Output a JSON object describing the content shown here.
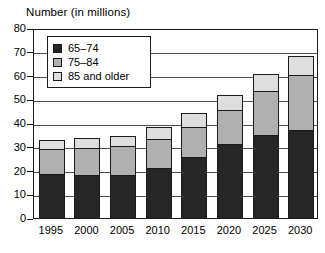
{
  "chart_data": {
    "type": "bar",
    "subtype": "stacked-vertical",
    "title": "Number (in millions)",
    "xlabel": "",
    "ylabel": "",
    "ylim": [
      0,
      80
    ],
    "ytick_step": 10,
    "yticks": [
      80,
      70,
      60,
      50,
      40,
      30,
      20,
      10,
      0
    ],
    "grid": true,
    "grid_axis": "y",
    "legend_position": "top-left-inside",
    "categories": [
      "1995",
      "2000",
      "2005",
      "2010",
      "2015",
      "2020",
      "2025",
      "2030"
    ],
    "series": [
      {
        "name": "65–74",
        "color": "#262626",
        "values": [
          19,
          18.5,
          18.5,
          21.5,
          26,
          31.5,
          35.5,
          37.5
        ]
      },
      {
        "name": "75–84",
        "color": "#b0b0b0",
        "values": [
          11,
          12,
          12.5,
          12.5,
          13,
          15,
          19,
          23.5
        ]
      },
      {
        "name": "85 and older",
        "color": "#dedede",
        "values": [
          4,
          4.5,
          5,
          5.5,
          6.5,
          6.5,
          7.5,
          8.5
        ]
      }
    ],
    "totals": [
      34,
      35,
      36,
      39.5,
      45.5,
      53,
      62,
      69.5
    ]
  },
  "legend": {
    "items": [
      {
        "label": "65–74",
        "color": "#262626",
        "swatch": "legend-swatch-dark"
      },
      {
        "label": "75–84",
        "color": "#b0b0b0",
        "swatch": "legend-swatch-mid"
      },
      {
        "label": "85 and older",
        "color": "#dedede",
        "swatch": "legend-swatch-light"
      }
    ]
  }
}
